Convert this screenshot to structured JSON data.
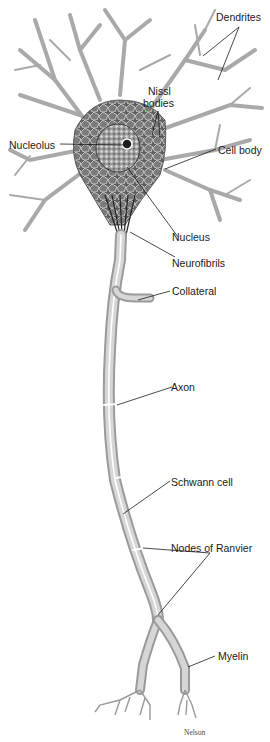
{
  "diagram": {
    "labels": {
      "dendrites": "Dendrites",
      "nissl_line1": "Nissl",
      "nissl_line2": "bodies",
      "nucleolus": "Nucleolus",
      "cell_body": "Cell body",
      "nucleus": "Nucleus",
      "neurofibrils": "Neurofibrils",
      "collateral": "Collateral",
      "axon": "Axon",
      "schwann_cell": "Schwann cell",
      "nodes_of_ranvier": "Nodes of Ranvier",
      "myelin": "Myelin"
    },
    "credit": "Nelson",
    "colors": {
      "background": "#ffffff",
      "cell_body_fill": "#6e6e6e",
      "dendrite_fill": "#b8b8b8",
      "axon_fill": "#c8c8c8",
      "label_text": "#1a1a1a",
      "leader_line": "#1a1a1a"
    }
  }
}
